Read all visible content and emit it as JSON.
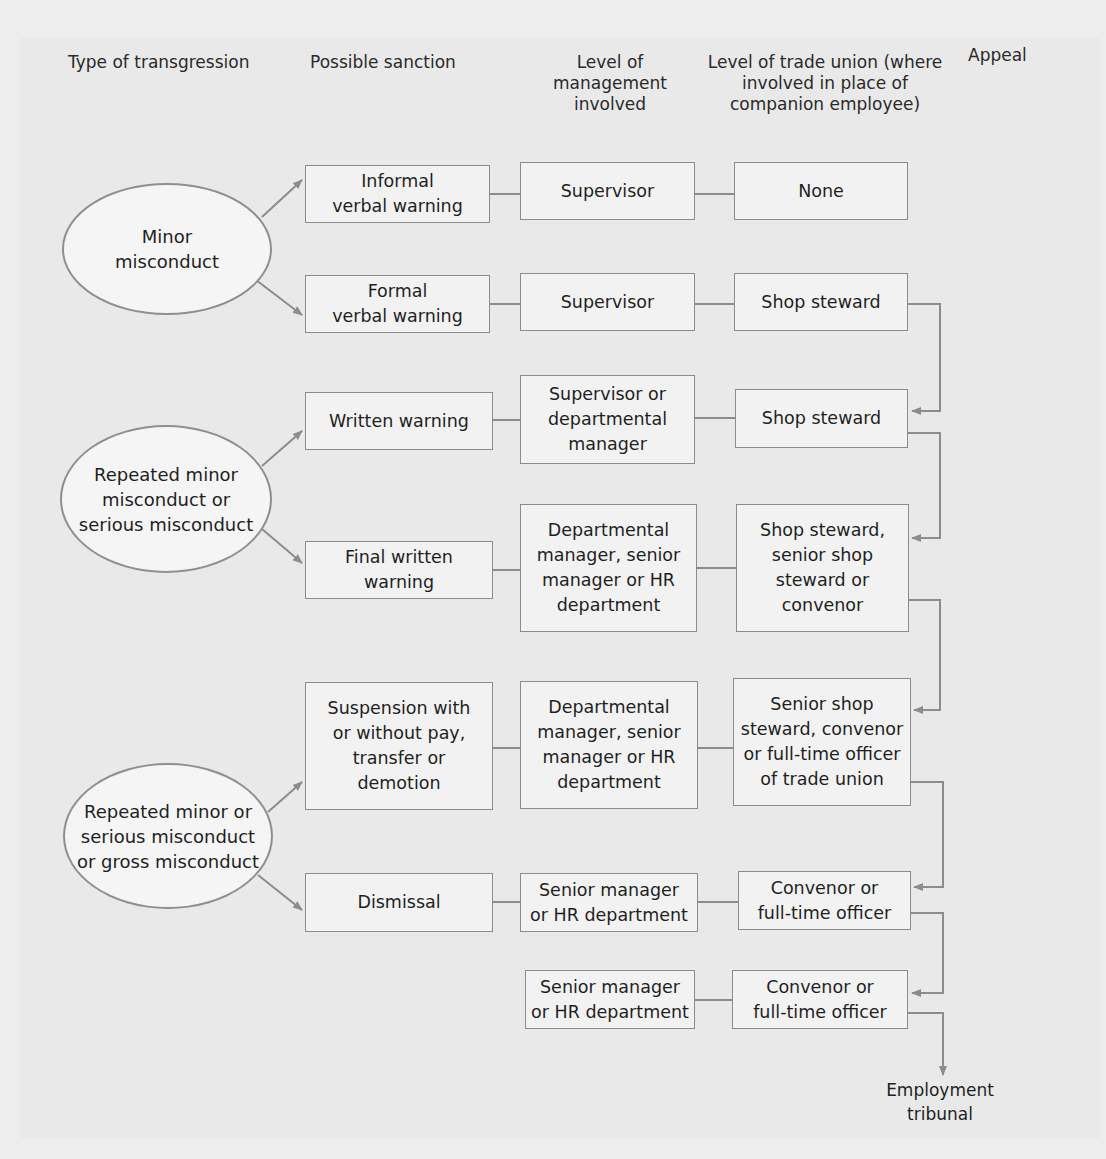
{
  "headers": {
    "transgression": "Type of transgression",
    "sanction": "Possible sanction",
    "management": "Level of\nmanagement\ninvolved",
    "union": "Level of trade union (where\ninvolved in place of\ncompanion employee)",
    "appeal": "Appeal"
  },
  "transgressions": [
    {
      "label": "Minor\nmisconduct"
    },
    {
      "label": "Repeated minor\nmisconduct or\nserious misconduct"
    },
    {
      "label": "Repeated minor or\nserious misconduct\nor gross misconduct"
    }
  ],
  "rows": [
    {
      "sanction": "Informal\nverbal warning",
      "management": "Supervisor",
      "union": "None"
    },
    {
      "sanction": "Formal\nverbal warning",
      "management": "Supervisor",
      "union": "Shop steward"
    },
    {
      "sanction": "Written warning",
      "management": "Supervisor or\ndepartmental\nmanager",
      "union": "Shop steward"
    },
    {
      "sanction": "Final written\nwarning",
      "management": "Departmental\nmanager, senior\nmanager or HR\ndepartment",
      "union": "Shop steward,\nsenior shop\nsteward or\nconvenor"
    },
    {
      "sanction": "Suspension with\nor without pay,\ntransfer or\ndemotion",
      "management": "Departmental\nmanager, senior\nmanager or HR\ndepartment",
      "union": "Senior shop\nsteward, convenor\nor full-time officer\nof trade union"
    },
    {
      "sanction": "Dismissal",
      "management": "Senior manager\nor HR department",
      "union": "Convenor or\nfull-time officer"
    },
    {
      "management": "Senior manager\nor HR department",
      "union": "Convenor or\nfull-time officer"
    }
  ],
  "appeal_final": "Employment\ntribunal",
  "colors": {
    "line": "#8c8c8c",
    "box_border": "#8c8c8c",
    "text": "#1f1f1f",
    "background": "#ededed"
  }
}
